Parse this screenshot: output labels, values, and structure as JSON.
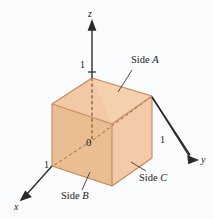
{
  "figure": {
    "background_color": "#fbfcfe",
    "axes": {
      "z": {
        "name": "z",
        "tick_label": "1"
      },
      "y": {
        "name": "y",
        "tick_label": "1"
      },
      "x": {
        "name": "x",
        "tick_label": "1"
      },
      "origin_label": "0"
    },
    "labels": {
      "side_a": {
        "prefix": "Side ",
        "letter": "A"
      },
      "side_b": {
        "prefix": "Side ",
        "letter": "B"
      },
      "side_c": {
        "prefix": "Side ",
        "letter": "C"
      }
    },
    "colors": {
      "face_top": "#f2c9a4",
      "face_left": "#eec198",
      "face_right": "#f3cba8",
      "face_bottom": "#eec49c",
      "edge": "#c08a5e",
      "axis": "#2b2b2b",
      "text": "#1a1a1a"
    }
  }
}
